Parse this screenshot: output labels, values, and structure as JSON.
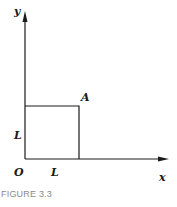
{
  "figure": {
    "caption": "FIGURE 3.3",
    "labels": {
      "y_axis": "y",
      "x_axis": "x",
      "origin": "O",
      "point": "A",
      "side_vertical": "L",
      "side_horizontal": "L"
    },
    "colors": {
      "line": "#1a1a1a",
      "caption": "#8a8a8a",
      "background": "#ffffff"
    }
  }
}
